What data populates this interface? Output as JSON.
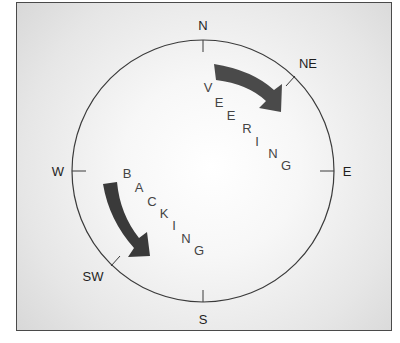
{
  "diagram": {
    "compass_labels": {
      "n": "N",
      "ne": "NE",
      "e": "E",
      "s": "S",
      "sw": "SW",
      "w": "W"
    },
    "veering": {
      "word": "VEERING",
      "letters": [
        "V",
        "E",
        "E",
        "R",
        "I",
        "N",
        "G"
      ],
      "direction": "clockwise"
    },
    "backing": {
      "word": "BACKING",
      "letters": [
        "B",
        "A",
        "C",
        "K",
        "I",
        "N",
        "G"
      ],
      "direction": "counter-clockwise"
    },
    "colors": {
      "arrow": "#4a4a4a",
      "circle": "#3a3a3a",
      "text": "#1e1e1e",
      "background": "#e6e6e6"
    }
  }
}
